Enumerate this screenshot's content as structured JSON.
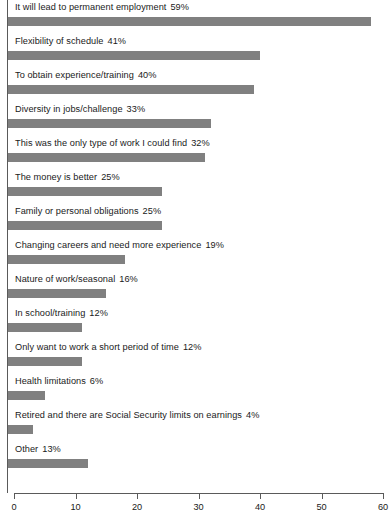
{
  "chart_data": {
    "type": "bar",
    "orientation": "horizontal",
    "title": "",
    "subtitle": "",
    "xlabel": "",
    "ylabel": "",
    "xlim": [
      0,
      60
    ],
    "xticks": [
      0,
      10,
      20,
      30,
      40,
      50,
      60
    ],
    "xtick_labels": [
      "0",
      "10",
      "20",
      "30",
      "40",
      "50",
      "60"
    ],
    "grid": false,
    "legend": false,
    "bar_color": "#808080",
    "axis_color": "#5a5a5a",
    "value_suffix": "%",
    "categories": [
      "It will lead to permanent employment",
      "Flexibility of schedule",
      "To obtain experience/training",
      "Diversity in jobs/challenge",
      "This was the only type of work I could find",
      "The money is better",
      "Family or personal obligations",
      "Changing careers and need more experience",
      "Nature of work/seasonal",
      "In school/training",
      "Only want to work a short period of time",
      "Health limitations",
      "Retired and there are Social Security limits on earnings",
      "Other"
    ],
    "values": [
      59,
      41,
      40,
      33,
      32,
      25,
      25,
      19,
      16,
      12,
      12,
      6,
      4,
      13
    ],
    "value_labels": [
      "59%",
      "41%",
      "40%",
      "33%",
      "32%",
      "25%",
      "25%",
      "19%",
      "16%",
      "12%",
      "12%",
      "6%",
      "4%",
      "13%"
    ]
  }
}
